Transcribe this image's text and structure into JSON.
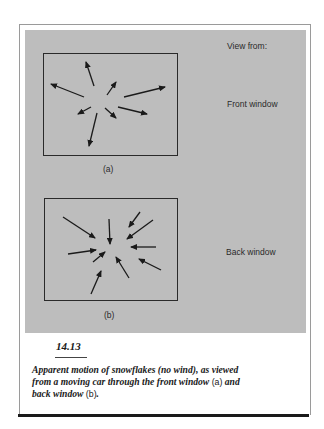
{
  "figure": {
    "header_label": "View from:",
    "panels": [
      {
        "id": "a",
        "sublabel": "(a)",
        "side_label": "Front window",
        "frame": {
          "x": 43,
          "y": 53,
          "w": 134,
          "h": 102
        },
        "arrows": [
          {
            "x1": 94,
            "y1": 86,
            "x2": 86,
            "y2": 62
          },
          {
            "x1": 107,
            "y1": 95,
            "x2": 116,
            "y2": 82
          },
          {
            "x1": 84,
            "y1": 97,
            "x2": 51,
            "y2": 84
          },
          {
            "x1": 124,
            "y1": 97,
            "x2": 165,
            "y2": 87
          },
          {
            "x1": 91,
            "y1": 107,
            "x2": 78,
            "y2": 114
          },
          {
            "x1": 105,
            "y1": 108,
            "x2": 116,
            "y2": 118
          },
          {
            "x1": 118,
            "y1": 107,
            "x2": 147,
            "y2": 114
          },
          {
            "x1": 97,
            "y1": 113,
            "x2": 89,
            "y2": 146
          }
        ]
      },
      {
        "id": "b",
        "sublabel": "(b)",
        "side_label": "Back window",
        "frame": {
          "x": 44,
          "y": 198,
          "w": 133,
          "h": 102
        },
        "arrows": [
          {
            "x1": 63,
            "y1": 217,
            "x2": 95,
            "y2": 238
          },
          {
            "x1": 109,
            "y1": 219,
            "x2": 110,
            "y2": 244
          },
          {
            "x1": 140,
            "y1": 212,
            "x2": 129,
            "y2": 227
          },
          {
            "x1": 153,
            "y1": 220,
            "x2": 127,
            "y2": 239
          },
          {
            "x1": 156,
            "y1": 247,
            "x2": 131,
            "y2": 247
          },
          {
            "x1": 161,
            "y1": 270,
            "x2": 139,
            "y2": 259
          },
          {
            "x1": 129,
            "y1": 278,
            "x2": 116,
            "y2": 257
          },
          {
            "x1": 68,
            "y1": 254,
            "x2": 96,
            "y2": 250
          },
          {
            "x1": 93,
            "y1": 262,
            "x2": 105,
            "y2": 252
          },
          {
            "x1": 91,
            "y1": 294,
            "x2": 101,
            "y2": 271
          }
        ]
      }
    ]
  },
  "caption": {
    "number": "14.13",
    "text_1": "Apparent motion of snowflakes (no wind), as viewed from a moving car through the front window ",
    "ref_a": "(a)",
    "text_2": " and back window ",
    "ref_b": "(b)",
    "text_3": "."
  },
  "colors": {
    "panel_gray": "#bdbdbd",
    "ink": "#1a1a1a"
  }
}
